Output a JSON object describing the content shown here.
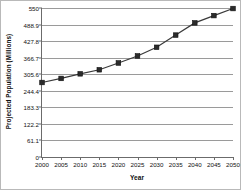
{
  "chart_data": {
    "type": "line",
    "title": "",
    "xlabel": "Year",
    "ylabel": "Projected Population (Millions)",
    "x": [
      2000,
      2005,
      2010,
      2015,
      2020,
      2025,
      2030,
      2035,
      2040,
      2045,
      2050
    ],
    "xtick_labels": [
      "2000",
      "2005",
      "2010",
      "2015",
      "2020",
      "2025",
      "2030",
      "2035",
      "2040",
      "2045",
      "2050"
    ],
    "values": [
      275,
      290,
      307,
      322,
      347,
      373,
      405,
      450,
      495,
      522,
      548
    ],
    "ytick_labels": [
      "0",
      "61.1",
      "122.2",
      "183.3",
      "244.4",
      "305.6",
      "366.7",
      "427.8",
      "488.9",
      "550"
    ],
    "ytick_values": [
      0,
      61.1,
      122.2,
      183.3,
      244.4,
      305.6,
      366.7,
      427.8,
      488.9,
      550
    ],
    "ylim": [
      0,
      550
    ],
    "xlim": [
      2000,
      2050
    ],
    "grid": true,
    "legend": "none",
    "series_color": "#3a3a3a",
    "marker_color": "#2b2b2b",
    "marker": "square",
    "gridline_color": "#9a9a9a",
    "axis_color": "#6b6b6b"
  }
}
